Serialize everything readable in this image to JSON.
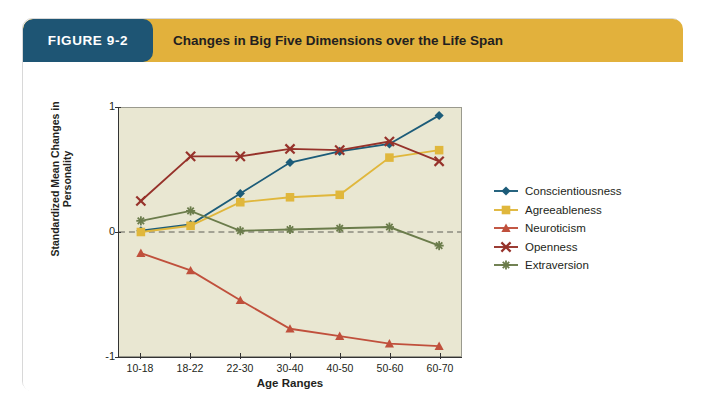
{
  "figure": {
    "tab_label": "FIGURE 9-2",
    "title": "Changes in Big Five Dimensions over the Life Span",
    "tab_color": "#1e5574",
    "header_color": "#e2b13c",
    "card_background": "#ffffff"
  },
  "chart_data": {
    "type": "line",
    "title": "Changes in Big Five Dimensions over the Life Span",
    "xlabel": "Age Ranges",
    "ylabel": "Standardized Mean Changes in Personality",
    "categories": [
      "10-18",
      "18-22",
      "22-30",
      "30-40",
      "40-50",
      "50-60",
      "60-70"
    ],
    "ylim": [
      -1,
      1
    ],
    "yticks": [
      1,
      0,
      -1
    ],
    "ytick_labels": [
      "1",
      "0",
      "-1"
    ],
    "grid": false,
    "zero_line": true,
    "zero_line_style": "dashed",
    "plot_background": "#e9e7d2",
    "legend_position": "right",
    "series": [
      {
        "name": "Conscientiousness",
        "color": "#1c5c79",
        "marker": "diamond",
        "values": [
          0.01,
          0.06,
          0.31,
          0.56,
          0.65,
          0.71,
          0.94
        ]
      },
      {
        "name": "Agreeableness",
        "color": "#e0b73c",
        "marker": "square",
        "values": [
          0.0,
          0.05,
          0.24,
          0.28,
          0.3,
          0.6,
          0.66
        ]
      },
      {
        "name": "Neuroticism",
        "color": "#c0503c",
        "marker": "triangle",
        "values": [
          -0.17,
          -0.31,
          -0.55,
          -0.78,
          -0.84,
          -0.9,
          -0.92
        ]
      },
      {
        "name": "Openness",
        "color": "#96322a",
        "marker": "x",
        "values": [
          0.25,
          0.61,
          0.61,
          0.67,
          0.66,
          0.73,
          0.57
        ]
      },
      {
        "name": "Extraversion",
        "color": "#6b7c4b",
        "marker": "asterisk",
        "values": [
          0.09,
          0.17,
          0.01,
          0.02,
          0.03,
          0.04,
          -0.11
        ]
      }
    ]
  }
}
